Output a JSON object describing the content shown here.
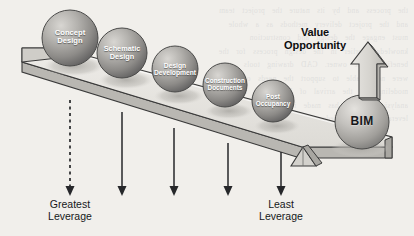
{
  "figure": {
    "kind": "lever-seesaw-diagram",
    "background_color": "#f1efeb",
    "scan_bleed_text": "the process and by its nature the project team\nand the project delivery methods as a whole\nmust engage the design and construction\nknowledge earlier in the design process for the\nbenefit of the owner. CAD drawing tools\nwere never able to support the needs of\nmodeling but the arrival of BIM tools and\nanalysis software has made it possible to\nleverage this knowledge earlier in the process."
  },
  "value_opportunity": {
    "label": "Value\nOpportunity",
    "arrow_icon": "up-arrow-3d",
    "direction": "up"
  },
  "spheres": [
    {
      "label": "Concept\nDesign",
      "cx": 70,
      "cy": 38,
      "r": 28,
      "font_size": 7.6,
      "text_color": "#ffffff"
    },
    {
      "label": "Schematic\nDesign",
      "cx": 122,
      "cy": 53,
      "r": 25,
      "font_size": 7.3,
      "text_color": "#ffffff"
    },
    {
      "label": "Design\nDevelopment",
      "cx": 175,
      "cy": 69,
      "r": 23,
      "font_size": 6.7,
      "text_color": "#ffffff"
    },
    {
      "label": "Construction\nDocuments",
      "cx": 225,
      "cy": 85,
      "r": 22,
      "font_size": 6.4,
      "text_color": "#ffffff"
    },
    {
      "label": "Post\nOccupancy",
      "cx": 273,
      "cy": 101,
      "r": 21,
      "font_size": 6.4,
      "text_color": "#ffffff"
    },
    {
      "label": "BIM",
      "cx": 362,
      "cy": 122,
      "r": 27,
      "font_size": 12,
      "text_color": "#16171a"
    }
  ],
  "leverage_arrows": [
    {
      "x": 70,
      "style": "dashed",
      "name": "arrow-concept-design"
    },
    {
      "x": 122,
      "style": "solid",
      "name": "arrow-schematic-design"
    },
    {
      "x": 174,
      "style": "solid",
      "name": "arrow-design-development"
    },
    {
      "x": 228,
      "style": "solid",
      "name": "arrow-construction-documents"
    },
    {
      "x": 281,
      "style": "solid",
      "name": "arrow-post-occupancy"
    }
  ],
  "axis_labels": {
    "left": "Greatest\nLeverage",
    "right": "Least\nLeverage"
  },
  "lever": {
    "fulcrum_icon": "triangle-fulcrum",
    "plank_top_color": "#e6e4df",
    "plank_edge_color": "#9a9792",
    "outline_color": "#3a3a3a"
  },
  "colors": {
    "sphere_light": "#cfcdc9",
    "sphere_mid": "#9d9b98",
    "sphere_dark": "#6a6967",
    "shadow": "#c3c1bc",
    "ink": "#16171a"
  }
}
